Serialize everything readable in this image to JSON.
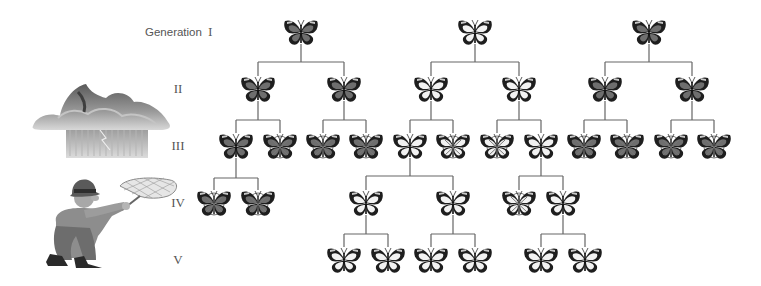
{
  "generation_label": "Generation",
  "generations": [
    {
      "roman": "I",
      "y": 32
    },
    {
      "roman": "II",
      "y": 89
    },
    {
      "roman": "III",
      "y": 146
    },
    {
      "roman": "IV",
      "y": 203
    },
    {
      "roman": "V",
      "y": 260
    }
  ],
  "colors": {
    "dark_wing": "#3a3a3a",
    "dark_fill": "#6e6e6e",
    "light_fill": "#f2f2f2",
    "stripe": "#c8c8c8",
    "line": "#555555",
    "label": "#555555"
  },
  "illustrations": [
    {
      "name": "storm-cloud",
      "description": "Storm cloud with rain and lightning"
    },
    {
      "name": "collector",
      "description": "Man with butterfly net"
    }
  ],
  "legend_note": "Butterflies marked with a circled cross are removed (do not reproduce)",
  "nodes": [
    {
      "id": "a",
      "gen": 1,
      "x": 301,
      "morph": "dark",
      "removed": false
    },
    {
      "id": "b",
      "gen": 1,
      "x": 475,
      "morph": "light",
      "removed": false
    },
    {
      "id": "c",
      "gen": 1,
      "x": 649,
      "morph": "dark",
      "removed": false
    },
    {
      "id": "a1",
      "gen": 2,
      "x": 258,
      "morph": "dark",
      "removed": false,
      "parent": "a"
    },
    {
      "id": "a2",
      "gen": 2,
      "x": 344,
      "morph": "dark",
      "removed": false,
      "parent": "a"
    },
    {
      "id": "b1",
      "gen": 2,
      "x": 431,
      "morph": "light",
      "removed": false,
      "parent": "b"
    },
    {
      "id": "b2",
      "gen": 2,
      "x": 519,
      "morph": "light",
      "removed": false,
      "parent": "b"
    },
    {
      "id": "c1",
      "gen": 2,
      "x": 605,
      "morph": "dark",
      "removed": false,
      "parent": "c"
    },
    {
      "id": "c2",
      "gen": 2,
      "x": 692,
      "morph": "dark",
      "removed": false,
      "parent": "c"
    },
    {
      "id": "a11",
      "gen": 3,
      "x": 236,
      "morph": "dark",
      "removed": false,
      "parent": "a1"
    },
    {
      "id": "a12",
      "gen": 3,
      "x": 280,
      "morph": "dark",
      "removed": true,
      "parent": "a1"
    },
    {
      "id": "a21",
      "gen": 3,
      "x": 323,
      "morph": "dark",
      "removed": true,
      "parent": "a2"
    },
    {
      "id": "a22",
      "gen": 3,
      "x": 366,
      "morph": "dark",
      "removed": true,
      "parent": "a2"
    },
    {
      "id": "b11",
      "gen": 3,
      "x": 410,
      "morph": "light",
      "removed": false,
      "parent": "b1"
    },
    {
      "id": "b12",
      "gen": 3,
      "x": 453,
      "morph": "light",
      "removed": true,
      "parent": "b1"
    },
    {
      "id": "b21",
      "gen": 3,
      "x": 497,
      "morph": "light",
      "removed": true,
      "parent": "b2"
    },
    {
      "id": "b22",
      "gen": 3,
      "x": 541,
      "morph": "light",
      "removed": false,
      "parent": "b2"
    },
    {
      "id": "c11",
      "gen": 3,
      "x": 584,
      "morph": "dark",
      "removed": true,
      "parent": "c1"
    },
    {
      "id": "c12",
      "gen": 3,
      "x": 627,
      "morph": "dark",
      "removed": true,
      "parent": "c1"
    },
    {
      "id": "c21",
      "gen": 3,
      "x": 671,
      "morph": "dark",
      "removed": true,
      "parent": "c2"
    },
    {
      "id": "c22",
      "gen": 3,
      "x": 714,
      "morph": "dark",
      "removed": true,
      "parent": "c2"
    },
    {
      "id": "a111",
      "gen": 4,
      "x": 214,
      "morph": "dark",
      "removed": true,
      "parent": "a11"
    },
    {
      "id": "a112",
      "gen": 4,
      "x": 258,
      "morph": "dark",
      "removed": true,
      "parent": "a11"
    },
    {
      "id": "b111",
      "gen": 4,
      "x": 366,
      "morph": "light",
      "removed": false,
      "parent": "b11"
    },
    {
      "id": "b112",
      "gen": 4,
      "x": 453,
      "morph": "light",
      "removed": false,
      "parent": "b11"
    },
    {
      "id": "b221",
      "gen": 4,
      "x": 519,
      "morph": "light",
      "removed": true,
      "parent": "b22"
    },
    {
      "id": "b222",
      "gen": 4,
      "x": 563,
      "morph": "light",
      "removed": false,
      "parent": "b22"
    },
    {
      "id": "b1111",
      "gen": 5,
      "x": 344,
      "morph": "light",
      "removed": false,
      "parent": "b111"
    },
    {
      "id": "b1112",
      "gen": 5,
      "x": 388,
      "morph": "light",
      "removed": false,
      "parent": "b111"
    },
    {
      "id": "b1121",
      "gen": 5,
      "x": 431,
      "morph": "light",
      "removed": false,
      "parent": "b112"
    },
    {
      "id": "b1122",
      "gen": 5,
      "x": 475,
      "morph": "light",
      "removed": false,
      "parent": "b112"
    },
    {
      "id": "b2221",
      "gen": 5,
      "x": 541,
      "morph": "light",
      "removed": false,
      "parent": "b222"
    },
    {
      "id": "b2222",
      "gen": 5,
      "x": 585,
      "morph": "light",
      "removed": false,
      "parent": "b222"
    }
  ]
}
